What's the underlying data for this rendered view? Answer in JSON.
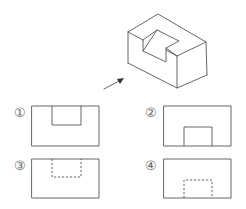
{
  "figure": {
    "arrow": {
      "direction": "view-direction"
    }
  },
  "options": [
    {
      "label": "①",
      "notch_position": "top",
      "line_style": "solid"
    },
    {
      "label": "②",
      "notch_position": "bottom",
      "line_style": "solid"
    },
    {
      "label": "③",
      "notch_position": "top",
      "line_style": "dashed"
    },
    {
      "label": "④",
      "notch_position": "bottom",
      "line_style": "dashed"
    }
  ],
  "colors": {
    "line": "#555555",
    "label": "#666666",
    "background": "#ffffff"
  }
}
